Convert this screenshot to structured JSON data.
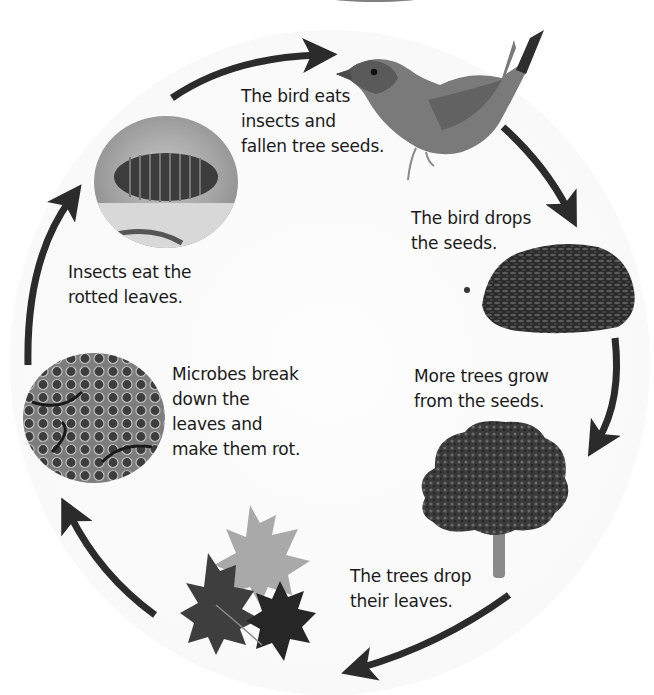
{
  "diagram": {
    "type": "cycle",
    "arrow_color": "#2b2b2b",
    "stages": [
      {
        "id": "bird",
        "image": "bird-photo",
        "caption": "The bird eats\ninsects and\nfallen tree seeds."
      },
      {
        "id": "seeds",
        "image": "seed-pile-photo",
        "caption": "The bird drops\nthe seeds."
      },
      {
        "id": "tree",
        "image": "tree-photo",
        "caption": "More trees grow\nfrom the seeds."
      },
      {
        "id": "leaves",
        "image": "maple-leaves-photo",
        "caption": "The trees drop\ntheir leaves."
      },
      {
        "id": "microbes",
        "image": "microbes-photo",
        "caption": "Microbes break\n down the\n leaves and\nmake them rot."
      },
      {
        "id": "insect",
        "image": "woodlouse-photo",
        "caption": "Insects eat the\nrotted leaves."
      }
    ]
  }
}
